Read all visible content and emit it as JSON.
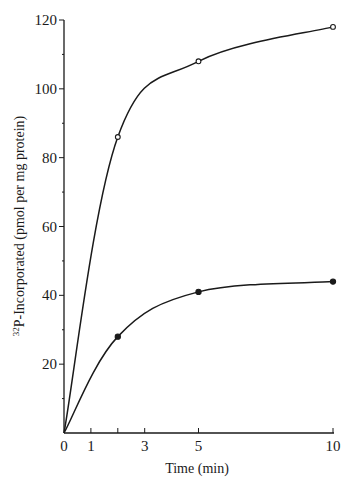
{
  "chart_data": {
    "type": "line",
    "title": "",
    "xlabel": "Time (min)",
    "ylabel": "32P-Incorporated (pmol per mg protein)",
    "ylabel_parts": {
      "superscript": "32",
      "main": "P-Incorporated (pmol per mg protein)"
    },
    "xlim": [
      0,
      10
    ],
    "ylim": [
      0,
      120
    ],
    "x_ticks": [
      0,
      1,
      2,
      3,
      5,
      10
    ],
    "x_tick_labels": [
      "0",
      "1",
      "",
      "3",
      "5",
      "10"
    ],
    "y_ticks": [
      0,
      10,
      20,
      30,
      40,
      50,
      60,
      70,
      80,
      90,
      100,
      110,
      120
    ],
    "y_tick_labels": [
      "",
      "",
      "20",
      "",
      "40",
      "",
      "60",
      "",
      "80",
      "",
      "100",
      "",
      "120"
    ],
    "grid": false,
    "legend": null,
    "series": [
      {
        "name": "open circles",
        "marker": "open-circle",
        "x": [
          0,
          2,
          5,
          10
        ],
        "y": [
          0,
          86,
          108,
          118
        ]
      },
      {
        "name": "filled circles",
        "marker": "filled-circle",
        "x": [
          0,
          2,
          5,
          10
        ],
        "y": [
          0,
          28,
          41,
          44
        ]
      }
    ]
  },
  "labels": {
    "x_axis_title": "Time (min)",
    "y_axis_superscript": "32",
    "y_axis_title": "P-Incorporated (pmol per mg protein)"
  },
  "colors": {
    "ink": "#1a1a1a",
    "background": "#ffffff"
  }
}
